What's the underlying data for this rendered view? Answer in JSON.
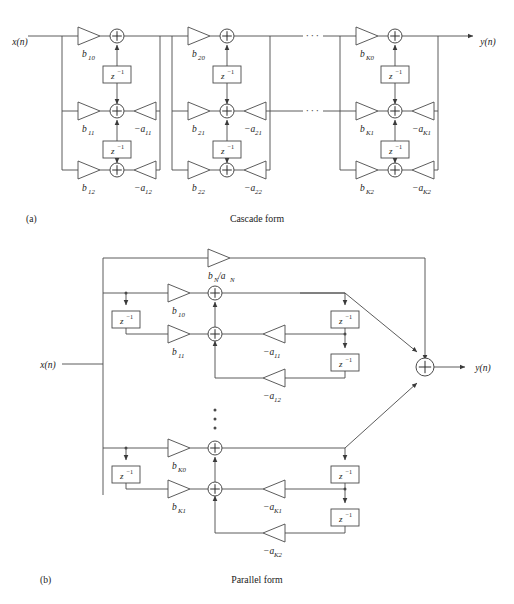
{
  "figure": {
    "background_color": "#ffffff",
    "line_color": "#4a4a4a",
    "text_color": "#1a1a1a"
  },
  "panels": [
    {
      "id": "a",
      "tag": "(a)",
      "caption": "Cascade form",
      "input_label": "x(n)",
      "output_label": "y(n)",
      "ellipsis": "···",
      "sections": [
        {
          "name": "section-1",
          "gains_feedforward": [
            "b₁₀",
            "b₁₁",
            "b₁₂"
          ],
          "gains_feedback": [
            "−a₁₁",
            "−a₁₂"
          ],
          "gain_parts": [
            {
              "base": "b",
              "sub": "10"
            },
            {
              "base": "b",
              "sub": "11"
            },
            {
              "base": "b",
              "sub": "12"
            },
            {
              "base": "−a",
              "sub": "11"
            },
            {
              "base": "−a",
              "sub": "12"
            }
          ],
          "delays": [
            "z⁻¹",
            "z⁻¹"
          ]
        },
        {
          "name": "section-2",
          "gains_feedforward": [
            "b₂₀",
            "b₂₁",
            "b₂₂"
          ],
          "gains_feedback": [
            "−a₂₁",
            "−a₂₂"
          ],
          "gain_parts": [
            {
              "base": "b",
              "sub": "20"
            },
            {
              "base": "b",
              "sub": "21"
            },
            {
              "base": "b",
              "sub": "22"
            },
            {
              "base": "−a",
              "sub": "21"
            },
            {
              "base": "−a",
              "sub": "22"
            }
          ],
          "delays": [
            "z⁻¹",
            "z⁻¹"
          ]
        },
        {
          "name": "section-K",
          "gains_feedforward": [
            "bₖ₀",
            "bₖ₁",
            "bₖ₂"
          ],
          "gains_feedback": [
            "−aₖ₁",
            "−aₖ₂"
          ],
          "gain_parts": [
            {
              "base": "b",
              "sub": "K0"
            },
            {
              "base": "b",
              "sub": "K1"
            },
            {
              "base": "b",
              "sub": "K2"
            },
            {
              "base": "−a",
              "sub": "K1"
            },
            {
              "base": "−a",
              "sub": "K2"
            }
          ],
          "delays": [
            "z⁻¹",
            "z⁻¹"
          ]
        }
      ]
    },
    {
      "id": "b",
      "tag": "(b)",
      "caption": "Parallel form",
      "input_label": "x(n)",
      "output_label": "y(n)",
      "ellipsis_vertical": "⋮",
      "direct_gain": {
        "base": "b",
        "sub": "N",
        "base2": "/a",
        "sub2": "N",
        "full": "bₙ/aₙ"
      },
      "sections": [
        {
          "name": "section-1",
          "gain_parts": [
            {
              "base": "b",
              "sub": "10"
            },
            {
              "base": "b",
              "sub": "11"
            },
            {
              "base": "−a",
              "sub": "11"
            },
            {
              "base": "−a",
              "sub": "12"
            }
          ],
          "delays_left": [
            "z⁻¹"
          ],
          "delays_right": [
            "z⁻¹",
            "z⁻¹"
          ]
        },
        {
          "name": "section-K",
          "gain_parts": [
            {
              "base": "b",
              "sub": "K0"
            },
            {
              "base": "b",
              "sub": "K1"
            },
            {
              "base": "−a",
              "sub": "K1"
            },
            {
              "base": "−a",
              "sub": "K2"
            }
          ],
          "delays_left": [
            "z⁻¹"
          ],
          "delays_right": [
            "z⁻¹",
            "z⁻¹"
          ]
        }
      ]
    }
  ],
  "symbols": {
    "delay_base": "z",
    "delay_exponent": "−1",
    "sum": "+"
  }
}
